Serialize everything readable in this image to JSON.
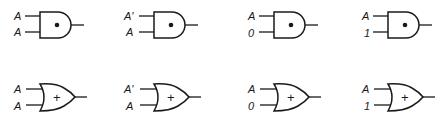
{
  "figure": {
    "and_row": [
      {
        "inputs": [
          "A",
          "A"
        ],
        "operator": "•",
        "gate": "AND"
      },
      {
        "inputs": [
          "A'",
          "A"
        ],
        "operator": "•",
        "gate": "AND"
      },
      {
        "inputs": [
          "A",
          "0"
        ],
        "operator": "•",
        "gate": "AND"
      },
      {
        "inputs": [
          "A",
          "1"
        ],
        "operator": "•",
        "gate": "AND"
      }
    ],
    "or_row": [
      {
        "inputs": [
          "A",
          "A"
        ],
        "operator": "+",
        "gate": "OR"
      },
      {
        "inputs": [
          "A'",
          "A"
        ],
        "operator": "+",
        "gate": "OR"
      },
      {
        "inputs": [
          "A",
          "0"
        ],
        "operator": "+",
        "gate": "OR"
      },
      {
        "inputs": [
          "A",
          "1"
        ],
        "operator": "+",
        "gate": "OR"
      }
    ]
  }
}
